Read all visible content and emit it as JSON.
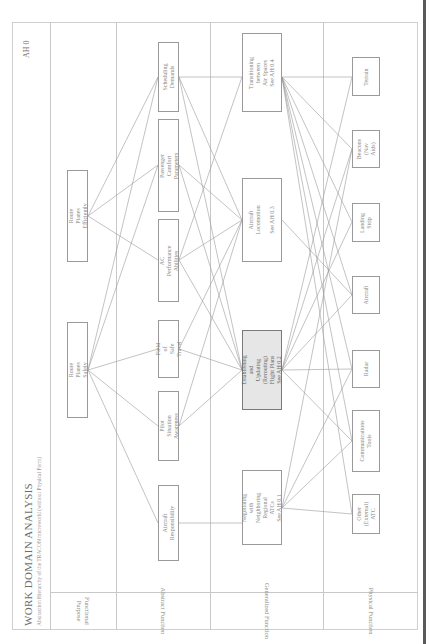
{
  "header": {
    "title": "WORK DOMAIN ANALYSIS",
    "subtitle": "Abstraction Hierarchy of the TRACON microworld (without Physical Form)",
    "id": "AH 0"
  },
  "levels": [
    {
      "label": "Functional\nPurpose"
    },
    {
      "label": "Abstract Function"
    },
    {
      "label": "Generalized Function"
    },
    {
      "label": "Physical Function"
    }
  ],
  "nodes": {
    "functional_purpose": [
      {
        "label": "Route Planes Efficiently"
      },
      {
        "label": "Route Planes Safely"
      }
    ],
    "abstract_function": [
      {
        "label": "Scheduling\nDemands"
      },
      {
        "label": "Passenger Comfort\nParameters"
      },
      {
        "label": "AC Performance\nAbilities"
      },
      {
        "label": "Field of\nSafe Travel"
      },
      {
        "label": "Pilot Situation\nAwareness"
      },
      {
        "label": "Aircraft\nResponsibility"
      }
    ],
    "generalized_function": [
      {
        "label": "Transitioning between\nAir Spaces\nSee AH 0.4"
      },
      {
        "label": "Aircraft Locomotion\n\nSee AH 0.3"
      },
      {
        "label": "Establishing and Updating\n(Rerouting) Flight Plans\nSee AH 0.2",
        "highlighted": true
      },
      {
        "label": "Negotiating with\nNeighboring Regional\nATCs\nSee AH 0.1"
      }
    ],
    "physical_function": [
      {
        "label": "Terrain"
      },
      {
        "label": "Beacons\n(Nav Aids)"
      },
      {
        "label": "Landing\nStrip"
      },
      {
        "label": "Aircraft"
      },
      {
        "label": "Radar"
      },
      {
        "label": "Communications\nTools"
      },
      {
        "label": "Other\n(External)\nATC"
      }
    ]
  },
  "colors": {
    "line": "#9a9a9a",
    "box_border": "#9a9a9a",
    "highlight_fill": "#e6e6e6",
    "binder": "#5a5a5a"
  }
}
